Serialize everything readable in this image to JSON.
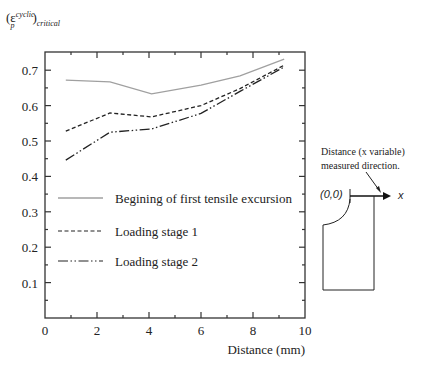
{
  "chart_data": {
    "type": "line",
    "title": "",
    "ylabel_parts": {
      "base": "(ε",
      "sup": "cyclic",
      "sub_p": "p",
      "close": ")",
      "sub": "critical"
    },
    "xlabel": "Distance (mm)",
    "xlim": [
      0,
      10
    ],
    "ylim": [
      0,
      0.75
    ],
    "xticks": [
      0,
      2,
      4,
      6,
      8,
      10
    ],
    "yticks": [
      0.1,
      0.2,
      0.3,
      0.4,
      0.5,
      0.6,
      0.7
    ],
    "grid": false,
    "legend_position": "inside-lower-left",
    "x": [
      0.8,
      2.5,
      4.1,
      6.0,
      7.5,
      9.2
    ],
    "series": [
      {
        "name": "Begining of first tensile excursion",
        "style": "solid",
        "color": "#a0a0a0",
        "values": [
          0.672,
          0.667,
          0.633,
          0.658,
          0.684,
          0.731
        ]
      },
      {
        "name": "Loading stage 1",
        "style": "dashed",
        "color": "#222222",
        "values": [
          0.528,
          0.579,
          0.568,
          0.6,
          0.648,
          0.714
        ]
      },
      {
        "name": "Loading stage 2",
        "style": "dash-dot",
        "color": "#222222",
        "values": [
          0.446,
          0.525,
          0.534,
          0.578,
          0.64,
          0.709
        ]
      }
    ]
  },
  "ylabel": {
    "base": "(ε",
    "sup": "cyclic",
    "sub_p": "p",
    "close": ")",
    "sub": "critical"
  },
  "xlabel": "Distance (mm)",
  "xtick_labels": [
    "0",
    "2",
    "4",
    "6",
    "8",
    "10"
  ],
  "ytick_labels": [
    "0.1",
    "0.2",
    "0.3",
    "0.4",
    "0.5",
    "0.6",
    "0.7"
  ],
  "legend": [
    {
      "label": "Begining of first tensile excursion"
    },
    {
      "label": "Loading stage 1"
    },
    {
      "label": "Loading stage 2"
    }
  ],
  "diagram": {
    "caption_line1": "Distance  (x  variable)",
    "caption_line2": "measured direction.",
    "origin_label": "(0,0)",
    "axis_label": "x"
  }
}
